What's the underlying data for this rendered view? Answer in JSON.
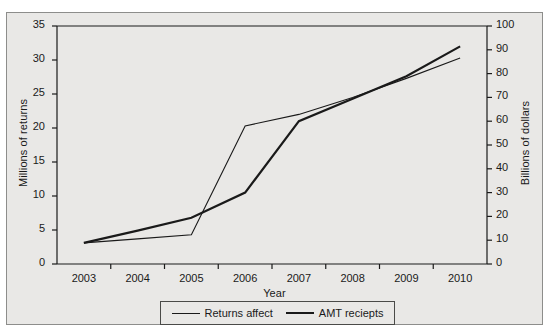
{
  "chart_data": {
    "type": "line",
    "title": "",
    "xlabel": "Year",
    "ylabel": "Millions of returns",
    "ylabel_right": "Billions of dollars",
    "categories": [
      "2003",
      "2004",
      "2005",
      "2006",
      "2007",
      "2008",
      "2009",
      "2010"
    ],
    "x": [
      2003,
      2004,
      2005,
      2006,
      2007,
      2008,
      2009,
      2010
    ],
    "ylim": [
      0,
      35
    ],
    "ylim_right": [
      0,
      100
    ],
    "yticks": [
      "0",
      "5",
      "10",
      "15",
      "20",
      "25",
      "30",
      "35"
    ],
    "ytick_values": [
      0,
      5,
      10,
      15,
      20,
      25,
      30,
      35
    ],
    "yticks_right": [
      "0",
      "10",
      "20",
      "30",
      "40",
      "50",
      "60",
      "70",
      "80",
      "90",
      "100"
    ],
    "ytick_values_right": [
      0,
      10,
      20,
      30,
      40,
      50,
      60,
      70,
      80,
      90,
      100
    ],
    "grid": false,
    "legend_position": "bottom",
    "series": [
      {
        "name": "Returns affect",
        "axis": "left",
        "units": "millions of returns",
        "line_width": "thin",
        "color": "#1a1a1a",
        "values": [
          3.1,
          3.7,
          4.3,
          20.3,
          22.0,
          24.5,
          27.3,
          30.3
        ]
      },
      {
        "name": "AMT reciepts",
        "axis": "right",
        "units": "billions of dollars",
        "line_width": "thick",
        "color": "#1a1a1a",
        "values_left_scale": [
          3.1,
          4.9,
          6.8,
          10.5,
          21.0,
          24.3,
          27.6,
          32.0
        ],
        "values": [
          8.9,
          14.0,
          19.4,
          30.0,
          60.0,
          69.4,
          78.9,
          91.4
        ]
      }
    ]
  },
  "legend": {
    "entries": [
      {
        "label": "Returns affect",
        "style": "thin"
      },
      {
        "label": "AMT reciepts",
        "style": "thick"
      }
    ]
  }
}
